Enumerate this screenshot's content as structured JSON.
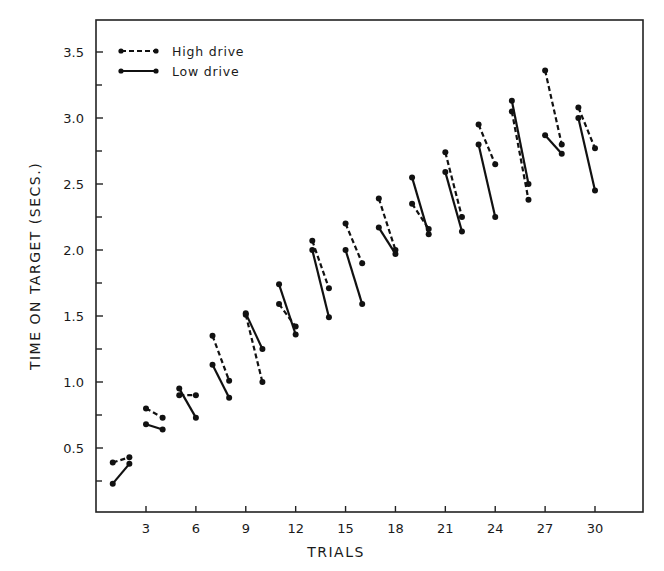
{
  "chart_data": {
    "type": "line",
    "title": "",
    "xlabel": "TRIALS",
    "ylabel": "TIME ON TARGET (SECS.)",
    "xlim": [
      0,
      32.5
    ],
    "ylim": [
      0,
      3.75
    ],
    "x_ticks": [
      3,
      6,
      9,
      12,
      15,
      18,
      21,
      24,
      27,
      30
    ],
    "x_tick_labels": [
      "3",
      "6",
      "9",
      "12",
      "15",
      "18",
      "21",
      "24",
      "27",
      "30"
    ],
    "y_ticks": [
      0.5,
      1.0,
      1.5,
      2.0,
      2.5,
      3.0,
      3.5
    ],
    "y_tick_labels": [
      "0.5",
      "1.0",
      "1.5",
      "2.0",
      "2.5",
      "3.0",
      "3.5"
    ],
    "y_minor_ticks": [
      0.25,
      0.75,
      1.25,
      1.75,
      2.25,
      2.75,
      3.25
    ],
    "grid": false,
    "legend_position": "upper-left",
    "note": "Data plotted as disconnected pairs of consecutive trials (1-2, 3-4, ... 29-30)",
    "series": [
      {
        "name": "High drive",
        "style": "dashed",
        "pairs": [
          {
            "x": [
              1,
              2
            ],
            "y": [
              0.39,
              0.43
            ]
          },
          {
            "x": [
              3,
              4
            ],
            "y": [
              0.8,
              0.73
            ]
          },
          {
            "x": [
              5,
              6
            ],
            "y": [
              0.9,
              0.9
            ]
          },
          {
            "x": [
              7,
              8
            ],
            "y": [
              1.35,
              1.01
            ]
          },
          {
            "x": [
              9,
              10
            ],
            "y": [
              1.51,
              1.0
            ]
          },
          {
            "x": [
              11,
              12
            ],
            "y": [
              1.59,
              1.42
            ]
          },
          {
            "x": [
              13,
              14
            ],
            "y": [
              2.07,
              1.71
            ]
          },
          {
            "x": [
              15,
              16
            ],
            "y": [
              2.2,
              1.9
            ]
          },
          {
            "x": [
              17,
              18
            ],
            "y": [
              2.39,
              2.0
            ]
          },
          {
            "x": [
              19,
              20
            ],
            "y": [
              2.35,
              2.16
            ]
          },
          {
            "x": [
              21,
              22
            ],
            "y": [
              2.74,
              2.25
            ]
          },
          {
            "x": [
              23,
              24
            ],
            "y": [
              2.95,
              2.65
            ]
          },
          {
            "x": [
              25,
              26
            ],
            "y": [
              3.05,
              2.38
            ]
          },
          {
            "x": [
              27,
              28
            ],
            "y": [
              3.36,
              2.8
            ]
          },
          {
            "x": [
              29,
              30
            ],
            "y": [
              3.08,
              2.77
            ]
          }
        ]
      },
      {
        "name": "Low drive",
        "style": "solid",
        "pairs": [
          {
            "x": [
              1,
              2
            ],
            "y": [
              0.23,
              0.38
            ]
          },
          {
            "x": [
              3,
              4
            ],
            "y": [
              0.68,
              0.64
            ]
          },
          {
            "x": [
              5,
              6
            ],
            "y": [
              0.95,
              0.73
            ]
          },
          {
            "x": [
              7,
              8
            ],
            "y": [
              1.13,
              0.88
            ]
          },
          {
            "x": [
              9,
              10
            ],
            "y": [
              1.52,
              1.25
            ]
          },
          {
            "x": [
              11,
              12
            ],
            "y": [
              1.74,
              1.36
            ]
          },
          {
            "x": [
              13,
              14
            ],
            "y": [
              2.0,
              1.49
            ]
          },
          {
            "x": [
              15,
              16
            ],
            "y": [
              2.0,
              1.59
            ]
          },
          {
            "x": [
              17,
              18
            ],
            "y": [
              2.17,
              1.97
            ]
          },
          {
            "x": [
              19,
              20
            ],
            "y": [
              2.55,
              2.12
            ]
          },
          {
            "x": [
              21,
              22
            ],
            "y": [
              2.59,
              2.14
            ]
          },
          {
            "x": [
              23,
              24
            ],
            "y": [
              2.8,
              2.25
            ]
          },
          {
            "x": [
              25,
              26
            ],
            "y": [
              3.13,
              2.5
            ]
          },
          {
            "x": [
              27,
              28
            ],
            "y": [
              2.87,
              2.73
            ]
          },
          {
            "x": [
              29,
              30
            ],
            "y": [
              3.0,
              2.45
            ]
          }
        ]
      }
    ]
  },
  "legend": {
    "items": [
      {
        "label": "High drive",
        "style": "dashed"
      },
      {
        "label": "Low drive",
        "style": "solid"
      }
    ]
  },
  "axes": {
    "x_title": "TRIALS",
    "y_title": "TIME ON TARGET (SECS.)"
  }
}
